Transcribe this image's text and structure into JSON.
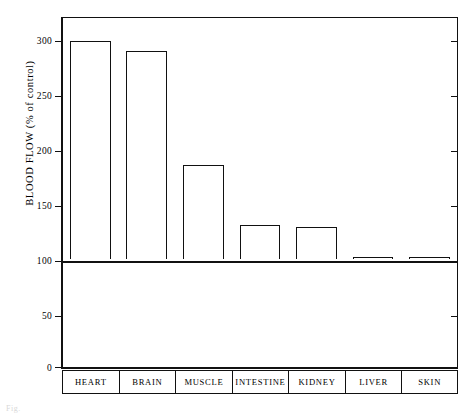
{
  "figure": {
    "caption_fragment": "Fig."
  },
  "chart_data": {
    "type": "bar",
    "title": "",
    "xlabel": "",
    "ylabel": "BLOOD FLOW (% of control)",
    "categories": [
      "HEART",
      "BRAIN",
      "MUSCLE",
      "INTESTINE",
      "KIDNEY",
      "LIVER",
      "SKIN"
    ],
    "values": [
      300,
      291,
      186,
      131,
      129,
      102,
      101
    ],
    "baseline": 100,
    "ylim": [
      0,
      320
    ],
    "yticks": [
      0,
      50,
      100,
      150,
      200,
      250,
      300
    ],
    "ytick_labels": [
      "0",
      "50",
      "100",
      "150",
      "200",
      "250",
      "300"
    ],
    "grid": false,
    "legend": null,
    "bar_fill": "#ffffff",
    "bar_edge": "#111111",
    "frame_color": "#111111",
    "right_axis_ticks": true
  }
}
